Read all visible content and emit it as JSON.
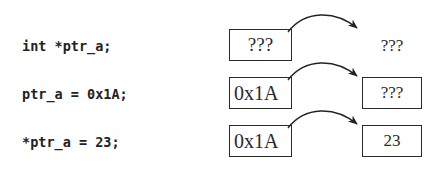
{
  "rows": [
    {
      "code": "int *ptr_a;",
      "pointer_value": "???",
      "target_value": "???",
      "target_boxed": false
    },
    {
      "code": "ptr_a = 0x1A;",
      "pointer_value": "0x1A",
      "target_value": "???",
      "target_boxed": true
    },
    {
      "code": "*ptr_a = 23;",
      "pointer_value": "0x1A",
      "target_value": "23",
      "target_boxed": true
    }
  ],
  "colors": {
    "line": "#2a2a2a",
    "text": "#222222",
    "background": "#ffffff"
  }
}
